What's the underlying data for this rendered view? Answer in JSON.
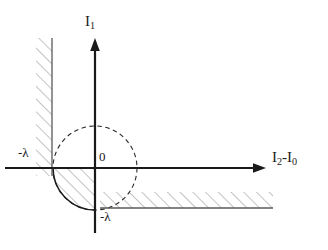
{
  "figure": {
    "kind": "math-diagram",
    "background_color": "#ffffff",
    "stroke_color": "#1a1a1a",
    "hatch_color": "#808080",
    "labels": {
      "y_axis": "I₁",
      "y_axis_base": "I",
      "y_axis_sub": "1",
      "x_axis": "I₂-I₀",
      "x_axis_base1": "I",
      "x_axis_sub1": "2",
      "x_axis_mid": "-",
      "x_axis_base2": "I",
      "x_axis_sub2": "0",
      "origin": "0",
      "lambda_x": "-λ",
      "lambda_y": "-λ"
    },
    "geometry": {
      "origin_x": 95,
      "origin_y": 168,
      "circle_radius": 42,
      "x_axis_left_end": 5,
      "x_axis_arrow_tip": 266,
      "y_axis_arrow_tip": 38,
      "y_axis_bottom_end": 233,
      "vertical_boundary_x": 52,
      "vertical_boundary_top": 38,
      "vertical_boundary_bottom": 176,
      "horizontal_boundary_y": 208,
      "horizontal_boundary_left": 100,
      "horizontal_boundary_right": 273
    }
  }
}
